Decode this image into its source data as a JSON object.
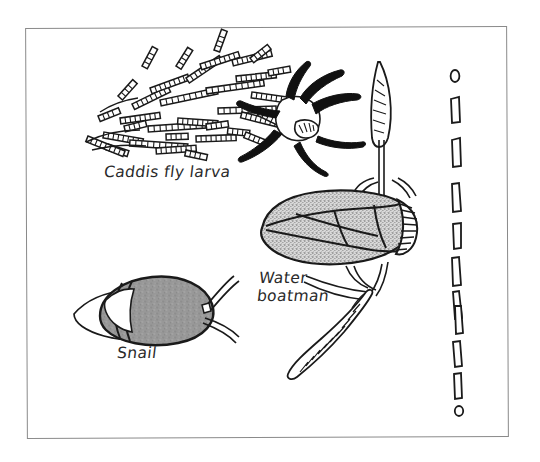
{
  "figure": {
    "kind": "hand-drawn-nature-illustration",
    "background_color": "#ffffff",
    "ink_color": "#1a1a1a",
    "frame": {
      "name": "illustration-border",
      "color": "#8a8a8a",
      "style": "thin single rule rectangle"
    }
  },
  "labels": {
    "caddis": "Caddis fly larva",
    "boatman": "Water\nboatman",
    "snail": "Snail"
  },
  "specimens": [
    {
      "name": "caddis-fly-larva",
      "label": "Caddis fly larva",
      "description": "Larva inside a protective case built from many small twigs and plant stems, with dark legs and pale head capsule projecting from the right end of the case.",
      "fill": "none",
      "outline": "#1a1a1a",
      "stick_count": 34
    },
    {
      "name": "water-boatman",
      "label": "Water boatman",
      "description": "Elongated oval stippled body with creased wing lines, striped eye-head at the right and long fringed oar-like swimming legs above and below.",
      "fill": "#b9b9b9",
      "outline": "#1a1a1a"
    },
    {
      "name": "snail",
      "label": "Snail",
      "description": "Grey shaded spiral shell with pale muscular foot beneath and two tentacles extending to the right.",
      "shell_fill": "#969696",
      "body_fill": "#ffffff",
      "outline": "#1a1a1a"
    }
  ],
  "scale_bar": {
    "name": "dashed-scale-rule",
    "orientation": "vertical",
    "style": "hand-drawn outlined dashes capped with a small circle at each end",
    "dash_count": 10,
    "end_marks": 2,
    "color": "#1a1a1a"
  },
  "colors": {
    "ink": "#1a1a1a",
    "frame": "#8a8a8a",
    "shell_gray": "#969696",
    "body_gray": "#b9b9b9",
    "paper": "#ffffff"
  }
}
